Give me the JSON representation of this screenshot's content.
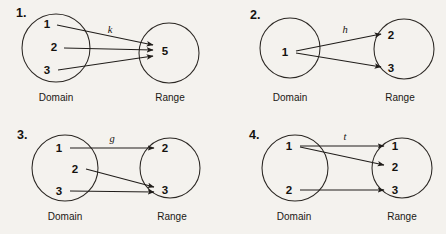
{
  "figure": {
    "background_color": "#f4f2ee",
    "ink_color": "#201d1a",
    "width": 446,
    "height": 234
  },
  "panels": [
    {
      "id": "panel-1",
      "number": "1.",
      "number_pos": [
        16,
        17
      ],
      "map_label": "k",
      "map_label_pos": [
        110,
        33
      ],
      "domain": {
        "caption": "Domain",
        "caption_pos": [
          56,
          101
        ],
        "circle": {
          "cx": 56,
          "cy": 48,
          "r": 34
        },
        "elements": [
          {
            "label": "1",
            "x": 47,
            "y": 28,
            "anchor_x": 56,
            "anchor_y": 29
          },
          {
            "label": "2",
            "x": 54,
            "y": 51,
            "anchor_x": 63,
            "anchor_y": 51
          },
          {
            "label": "3",
            "x": 47,
            "y": 74,
            "anchor_x": 57,
            "anchor_y": 72
          }
        ]
      },
      "range": {
        "caption": "Range",
        "caption_pos": [
          170,
          101
        ],
        "circle": {
          "cx": 169,
          "cy": 53,
          "r": 30
        },
        "elements": [
          {
            "label": "5",
            "x": 165,
            "y": 55,
            "target_x": 154,
            "target_y": 51
          }
        ]
      },
      "arrows": [
        {
          "from": [
            57,
            25
          ],
          "to": [
            153,
            45
          ]
        },
        {
          "from": [
            64,
            48
          ],
          "to": [
            153,
            50
          ]
        },
        {
          "from": [
            58,
            70
          ],
          "to": [
            153,
            56
          ]
        }
      ]
    },
    {
      "id": "panel-2",
      "number": "2.",
      "number_pos": [
        250,
        19
      ],
      "map_label": "h",
      "map_label_pos": [
        345,
        33
      ],
      "domain": {
        "caption": "Domain",
        "caption_pos": [
          290,
          101
        ],
        "circle": {
          "cx": 290,
          "cy": 48,
          "r": 30
        },
        "elements": [
          {
            "label": "1",
            "x": 285,
            "y": 56,
            "anchor_x": 295,
            "anchor_y": 52
          }
        ]
      },
      "range": {
        "caption": "Range",
        "caption_pos": [
          400,
          101
        ],
        "circle": {
          "cx": 404,
          "cy": 49,
          "r": 30
        },
        "elements": [
          {
            "label": "2",
            "x": 391,
            "y": 39,
            "target_x": 383,
            "target_y": 35
          },
          {
            "label": "3",
            "x": 391,
            "y": 72,
            "target_x": 383,
            "target_y": 68
          }
        ]
      },
      "arrows": [
        {
          "from": [
            296,
            51
          ],
          "to": [
            381,
            34
          ]
        },
        {
          "from": [
            296,
            53
          ],
          "to": [
            381,
            67
          ]
        }
      ]
    },
    {
      "id": "panel-3",
      "number": "3.",
      "number_pos": [
        17,
        139
      ],
      "map_label": "g",
      "map_label_pos": [
        112,
        142
      ],
      "domain": {
        "caption": "Domain",
        "caption_pos": [
          65,
          220
        ],
        "circle": {
          "cx": 65,
          "cy": 168,
          "r": 33
        },
        "elements": [
          {
            "label": "1",
            "x": 59,
            "y": 152,
            "anchor_x": 68,
            "anchor_y": 148
          },
          {
            "label": "2",
            "x": 75,
            "y": 173,
            "anchor_x": 84,
            "anchor_y": 169
          },
          {
            "label": "3",
            "x": 59,
            "y": 195,
            "anchor_x": 68,
            "anchor_y": 191
          }
        ]
      },
      "range": {
        "caption": "Range",
        "caption_pos": [
          172,
          220
        ],
        "circle": {
          "cx": 170,
          "cy": 168,
          "r": 30
        },
        "elements": [
          {
            "label": "2",
            "x": 165,
            "y": 152,
            "target_x": 156,
            "target_y": 148
          },
          {
            "label": "3",
            "x": 165,
            "y": 194,
            "target_x": 156,
            "target_y": 190
          }
        ]
      },
      "arrows": [
        {
          "from": [
            70,
            148
          ],
          "to": [
            154,
            148
          ]
        },
        {
          "from": [
            86,
            169
          ],
          "to": [
            154,
            187
          ]
        },
        {
          "from": [
            70,
            191
          ],
          "to": [
            154,
            192
          ]
        }
      ]
    },
    {
      "id": "panel-4",
      "number": "4.",
      "number_pos": [
        249,
        139
      ],
      "map_label": "t",
      "map_label_pos": [
        345,
        140
      ],
      "domain": {
        "caption": "Domain",
        "caption_pos": [
          294,
          220
        ],
        "circle": {
          "cx": 295,
          "cy": 168,
          "r": 33
        },
        "elements": [
          {
            "label": "1",
            "x": 289,
            "y": 150,
            "anchor_x": 298,
            "anchor_y": 146
          },
          {
            "label": "2",
            "x": 289,
            "y": 194,
            "anchor_x": 298,
            "anchor_y": 190
          }
        ]
      },
      "range": {
        "caption": "Range",
        "caption_pos": [
          402,
          220
        ],
        "circle": {
          "cx": 402,
          "cy": 168,
          "r": 30
        },
        "elements": [
          {
            "label": "1",
            "x": 395,
            "y": 150,
            "target_x": 386,
            "target_y": 146
          },
          {
            "label": "2",
            "x": 395,
            "y": 171,
            "target_x": 386,
            "target_y": 167
          },
          {
            "label": "3",
            "x": 395,
            "y": 194,
            "target_x": 386,
            "target_y": 190
          }
        ]
      },
      "arrows": [
        {
          "from": [
            300,
            146
          ],
          "to": [
            384,
            146
          ]
        },
        {
          "from": [
            300,
            147
          ],
          "to": [
            384,
            165
          ]
        },
        {
          "from": [
            300,
            190
          ],
          "to": [
            384,
            190
          ]
        }
      ]
    }
  ],
  "captions": {
    "domain": "Domain",
    "range": "Range"
  }
}
